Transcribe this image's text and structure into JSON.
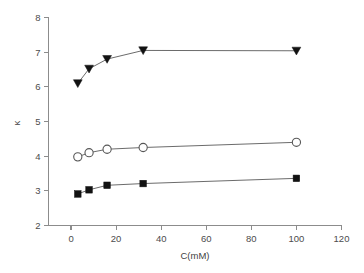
{
  "chart_data": {
    "type": "line",
    "title": "",
    "subtitle": "",
    "xlabel": "C(mM)",
    "ylabel": "κ",
    "xlim": [
      -10,
      120
    ],
    "ylim": [
      2,
      8
    ],
    "xticks": [
      0,
      20,
      40,
      60,
      80,
      100,
      120
    ],
    "xticklabels": [
      "0",
      "20",
      "40",
      "60",
      "80",
      "100",
      "120"
    ],
    "yticks": [
      2,
      3,
      4,
      5,
      6,
      7,
      8
    ],
    "yticklabels": [
      "2",
      "3",
      "4",
      "5",
      "6",
      "7",
      "8"
    ],
    "grid": false,
    "legend": "none",
    "x": [
      3,
      8,
      16,
      32,
      100
    ],
    "series": [
      {
        "name": "filled-down-triangle",
        "marker": "triangle-down-filled",
        "color": "#121212",
        "x": [
          3,
          8,
          16,
          32,
          100
        ],
        "values": [
          6.1,
          6.52,
          6.8,
          7.05,
          7.04
        ]
      },
      {
        "name": "open-circle",
        "marker": "circle-open",
        "color": "#575757",
        "x": [
          3,
          8,
          16,
          32,
          100
        ],
        "values": [
          3.98,
          4.1,
          4.2,
          4.25,
          4.4
        ]
      },
      {
        "name": "filled-square",
        "marker": "square-filled",
        "color": "#121212",
        "x": [
          3,
          8,
          16,
          32,
          100
        ],
        "values": [
          2.91,
          3.03,
          3.16,
          3.21,
          3.36
        ]
      }
    ]
  },
  "axes": {
    "x_axis_label": "C(mM)",
    "y_axis_label": "κ"
  }
}
